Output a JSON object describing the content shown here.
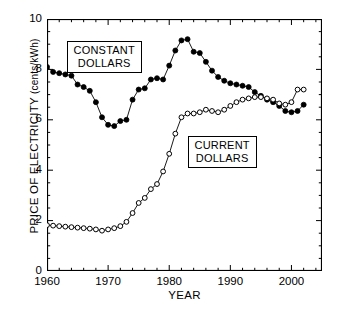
{
  "chart_data": {
    "type": "line",
    "title": "",
    "xlabel": "YEAR",
    "ylabel": "PRICE OF ELECTRICITY (cents/kWh)",
    "ylabel_main": "PRICE OF ELECTRICITY",
    "ylabel_unit": "(cents/kWh)",
    "xlim": [
      1960,
      2005
    ],
    "ylim": [
      0,
      10
    ],
    "xticks": [
      1960,
      1970,
      1980,
      1990,
      2000
    ],
    "yticks": [
      0,
      2,
      4,
      6,
      8,
      10
    ],
    "xtick_labels": [
      "1960",
      "1970",
      "1980",
      "1990",
      "2000"
    ],
    "ytick_labels": [
      "0",
      "2",
      "4",
      "6",
      "8",
      "10"
    ],
    "x_minor_step": 2,
    "y_minor_step": 0.5,
    "grid": false,
    "legend_position": "in-plot-boxed-annotations",
    "series": [
      {
        "name": "CONSTANT DOLLARS",
        "marker": "filled-circle",
        "color": "#000000",
        "x": [
          1960,
          1961,
          1962,
          1963,
          1964,
          1965,
          1966,
          1967,
          1968,
          1969,
          1970,
          1971,
          1972,
          1973,
          1974,
          1975,
          1976,
          1977,
          1978,
          1979,
          1980,
          1981,
          1982,
          1983,
          1984,
          1985,
          1986,
          1987,
          1988,
          1989,
          1990,
          1991,
          1992,
          1993,
          1994,
          1995,
          1996,
          1997,
          1998,
          1999,
          2000,
          2001,
          2002
        ],
        "values": [
          8.1,
          7.9,
          7.85,
          7.8,
          7.75,
          7.4,
          7.3,
          7.15,
          6.7,
          6.1,
          5.8,
          5.75,
          5.95,
          6.0,
          6.8,
          7.2,
          7.25,
          7.6,
          7.65,
          7.6,
          8.15,
          8.75,
          9.15,
          9.2,
          8.7,
          8.65,
          8.3,
          7.95,
          7.7,
          7.55,
          7.45,
          7.4,
          7.35,
          7.3,
          7.1,
          6.95,
          6.8,
          6.7,
          6.55,
          6.35,
          6.3,
          6.35,
          6.6
        ]
      },
      {
        "name": "CURRENT DOLLARS",
        "marker": "open-circle",
        "color": "#000000",
        "x": [
          1960,
          1961,
          1962,
          1963,
          1964,
          1965,
          1966,
          1967,
          1968,
          1969,
          1970,
          1971,
          1972,
          1973,
          1974,
          1975,
          1976,
          1977,
          1978,
          1979,
          1980,
          1981,
          1982,
          1983,
          1984,
          1985,
          1986,
          1987,
          1988,
          1989,
          1990,
          1991,
          1992,
          1993,
          1994,
          1995,
          1996,
          1997,
          1998,
          1999,
          2000,
          2001,
          2002
        ],
        "values": [
          1.82,
          1.8,
          1.78,
          1.76,
          1.74,
          1.72,
          1.7,
          1.68,
          1.65,
          1.6,
          1.65,
          1.7,
          1.78,
          1.95,
          2.3,
          2.7,
          2.9,
          3.25,
          3.45,
          3.95,
          4.65,
          5.45,
          6.1,
          6.25,
          6.25,
          6.3,
          6.4,
          6.35,
          6.3,
          6.4,
          6.55,
          6.7,
          6.8,
          6.85,
          6.9,
          6.9,
          6.85,
          6.8,
          6.65,
          6.6,
          6.7,
          7.2,
          7.2
        ]
      }
    ],
    "annotations": [
      {
        "name": "constant-dollars-label",
        "line1": "CONSTANT",
        "line2": "DOLLARS"
      },
      {
        "name": "current-dollars-label",
        "line1": "CURRENT",
        "line2": "DOLLARS"
      }
    ]
  }
}
